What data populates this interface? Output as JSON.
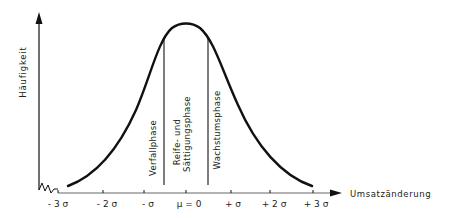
{
  "diagram": {
    "type": "normal-distribution-phases",
    "y_axis": {
      "label": "Häufigkeit"
    },
    "x_axis": {
      "label": "Umsatzänderung",
      "ticks": [
        "- 3 σ",
        "- 2 σ",
        "- σ",
        "μ = 0",
        "+ σ",
        "+ 2 σ",
        "+ 3 σ"
      ]
    },
    "phases": {
      "decline": "Verfallphase",
      "maturity_line1": "Reife- und",
      "maturity_line2": "Sättigungsphase",
      "growth": "Wachstumsphase"
    }
  }
}
